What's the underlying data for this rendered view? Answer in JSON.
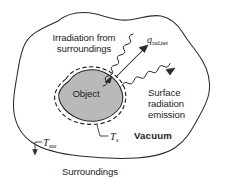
{
  "figure": {
    "type": "heat-transfer-schematic",
    "background_color": "#ffffff",
    "line_color": "#2a2a2a",
    "object_fill_color": "#b9b9b9",
    "text_color": "#1d1d1d"
  },
  "labels": {
    "irradiation": "Irradiation from\nsurroundings",
    "q_rad_net_symbol": "q",
    "q_rad_net_subscript": "rad,net",
    "surface_emission": "Surface\nradiation\nemission",
    "object": "Object",
    "vacuum": "Vacuum",
    "surroundings": "Surroundings",
    "t_s_symbol": "T",
    "t_s_subscript": "s",
    "t_sur_symbol": "T",
    "t_sur_subscript": "sur"
  },
  "elements": {
    "outer_boundary": "irregular-closed-curve-solid",
    "object_body": "irregular-blob-gray-filled",
    "object_dashed_boundary": "dashed-control-surface",
    "incoming_wavy_arrow": "irradiation-wavy-arrow",
    "outgoing_wavy_arrow": "emission-wavy-arrow",
    "net_flux_arrow": "straight-arrow-up-right",
    "t_s_leader": "leader-line",
    "t_sur_leader": "leader-line"
  }
}
